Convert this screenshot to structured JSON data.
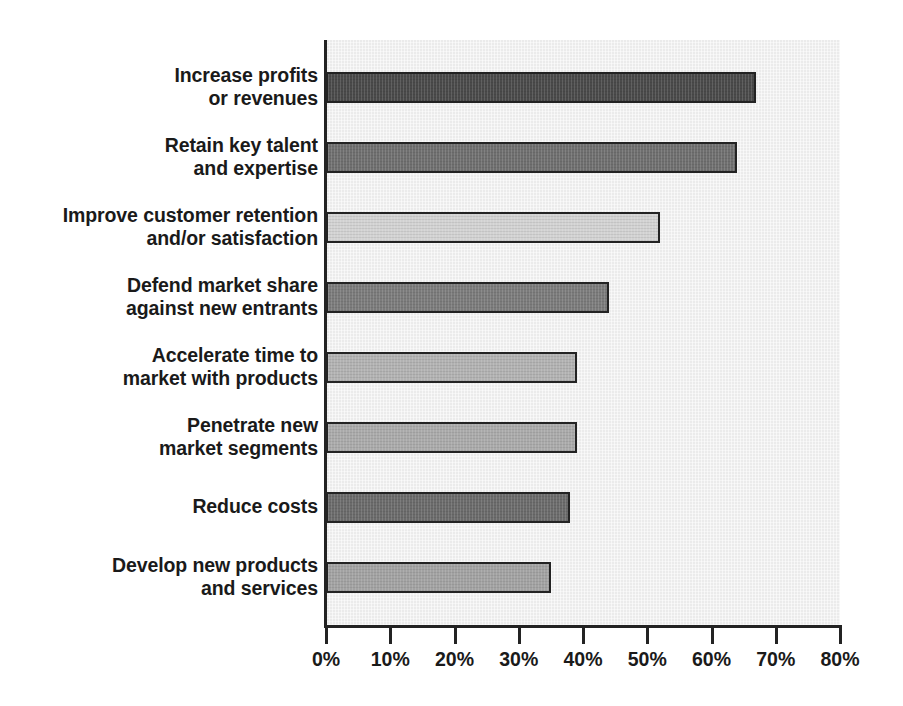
{
  "chart_data": {
    "type": "bar",
    "orientation": "horizontal",
    "title": "",
    "subtitle": "",
    "xlabel": "",
    "ylabel": "",
    "xlim": [
      0,
      80
    ],
    "grid": false,
    "legend": null,
    "value_suffix": "%",
    "xticks": [
      {
        "value": 0,
        "label": "0%"
      },
      {
        "value": 10,
        "label": "10%"
      },
      {
        "value": 20,
        "label": "20%"
      },
      {
        "value": 30,
        "label": "30%"
      },
      {
        "value": 40,
        "label": "40%"
      },
      {
        "value": 50,
        "label": "50%"
      },
      {
        "value": 60,
        "label": "60%"
      },
      {
        "value": 70,
        "label": "70%"
      },
      {
        "value": 80,
        "label": "80%"
      }
    ],
    "categories": [
      "Increase profits or revenues",
      "Retain key talent and expertise",
      "Improve customer retention and/or satisfaction",
      "Defend market share against new entrants",
      "Accelerate time to market with products",
      "Penetrate new market segments",
      "Reduce costs",
      "Develop new products and services"
    ],
    "category_lines": [
      [
        "Increase profits",
        "or revenues"
      ],
      [
        "Retain key talent",
        "and expertise"
      ],
      [
        "Improve customer retention",
        "and/or satisfaction"
      ],
      [
        "Defend market share",
        "against new entrants"
      ],
      [
        "Accelerate time to",
        "market with products"
      ],
      [
        "Penetrate new",
        "market segments"
      ],
      [
        "Reduce costs"
      ],
      [
        "Develop new products",
        "and services"
      ]
    ],
    "values": [
      67,
      64,
      52,
      44,
      39,
      39,
      38,
      35
    ],
    "bar_colors": [
      "#4a4a4a",
      "#6f6f6f",
      "#d2d2d2",
      "#7b7b7b",
      "#b2b2b2",
      "#aaaaaa",
      "#6b6b6b",
      "#a2a2a2"
    ]
  },
  "style": {
    "plot_background": "#ebebeb",
    "axis_color": "#232323",
    "text_color": "#1a1a1a",
    "page_background": "#ffffff"
  }
}
